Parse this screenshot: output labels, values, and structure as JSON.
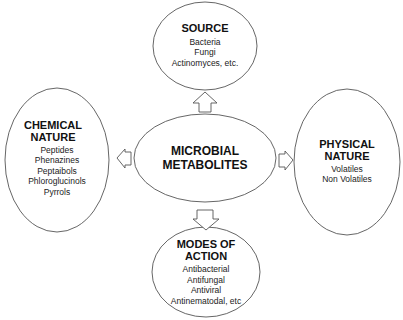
{
  "diagram": {
    "center": {
      "lines": [
        "MICROBIAL",
        "METABOLITES"
      ]
    },
    "nodes": {
      "source": {
        "title": [
          "SOURCE"
        ],
        "items": [
          "Bacteria",
          "Fungi",
          "Actinomyces, etc."
        ]
      },
      "chemical_nature": {
        "title": [
          "CHEMICAL",
          "NATURE"
        ],
        "items": [
          "Peptides",
          "Phenazines",
          "Peptaibols",
          "Phloroglucinols",
          "Pyrrols"
        ]
      },
      "physical_nature": {
        "title": [
          "PHYSICAL",
          "NATURE"
        ],
        "items": [
          "Volatiles",
          "Non Volatiles"
        ]
      },
      "modes_of_action": {
        "title": [
          "MODES OF",
          "ACTION"
        ],
        "items": [
          "Antibacterial",
          "Antifungal",
          "Antiviral",
          "Antinematodal, etc"
        ]
      }
    },
    "arrows": [
      {
        "from": "center",
        "to": "source",
        "direction": "up"
      },
      {
        "from": "center",
        "to": "chemical_nature",
        "direction": "left"
      },
      {
        "from": "center",
        "to": "physical_nature",
        "direction": "right"
      },
      {
        "from": "center",
        "to": "modes_of_action",
        "direction": "down"
      }
    ],
    "colors": {
      "stroke": "#555555",
      "background": "#ffffff",
      "text": "#1a1a1a"
    }
  }
}
